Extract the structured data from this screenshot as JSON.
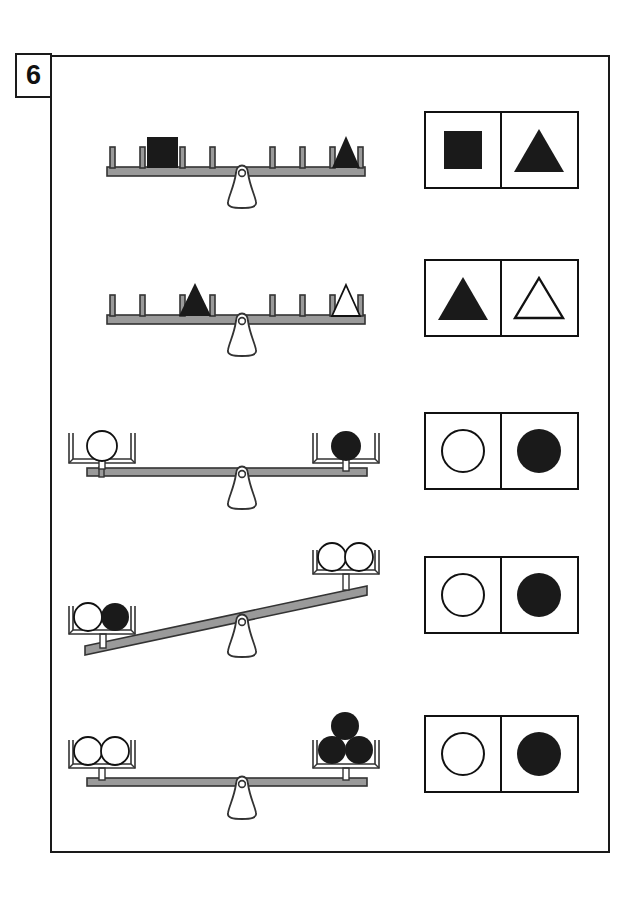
{
  "worksheet": {
    "number_label": "6",
    "colors": {
      "ink": "#1a1a1a",
      "beam_fill": "#9a9a9a",
      "beam_stroke": "#333333",
      "fill_black": "#1a1a1a",
      "fill_white": "#ffffff",
      "page_background": "#ffffff"
    }
  },
  "rows": [
    {
      "id": "row-1",
      "balance": {
        "style": "pegged-beam",
        "tilt": "level",
        "left": {
          "shapes": [
            {
              "type": "square",
              "fill": "black",
              "count": 1
            }
          ]
        },
        "right": {
          "shapes": [
            {
              "type": "triangle",
              "fill": "black",
              "count": 1
            }
          ]
        },
        "peg_count": 8
      },
      "answer": {
        "left": {
          "type": "square",
          "fill": "black"
        },
        "right": {
          "type": "triangle",
          "fill": "black"
        }
      }
    },
    {
      "id": "row-2",
      "balance": {
        "style": "pegged-beam",
        "tilt": "level",
        "left": {
          "shapes": [
            {
              "type": "triangle",
              "fill": "black",
              "count": 1
            }
          ]
        },
        "right": {
          "shapes": [
            {
              "type": "triangle",
              "fill": "white",
              "count": 1
            }
          ]
        },
        "peg_count": 8
      },
      "answer": {
        "left": {
          "type": "triangle",
          "fill": "black"
        },
        "right": {
          "type": "triangle",
          "fill": "white"
        }
      }
    },
    {
      "id": "row-3",
      "balance": {
        "style": "tray-beam",
        "tilt": "level",
        "left": {
          "shapes": [
            {
              "type": "circle",
              "fill": "white",
              "count": 1
            }
          ]
        },
        "right": {
          "shapes": [
            {
              "type": "circle",
              "fill": "black",
              "count": 1
            }
          ]
        }
      },
      "answer": {
        "left": {
          "type": "circle",
          "fill": "white"
        },
        "right": {
          "type": "circle",
          "fill": "black"
        }
      }
    },
    {
      "id": "row-4",
      "balance": {
        "style": "tray-beam",
        "tilt": "left-down",
        "left": {
          "shapes": [
            {
              "type": "circle",
              "fill": "white",
              "count": 1
            },
            {
              "type": "circle",
              "fill": "black",
              "count": 1
            }
          ]
        },
        "right": {
          "shapes": [
            {
              "type": "circle",
              "fill": "white",
              "count": 2
            }
          ]
        }
      },
      "answer": {
        "left": {
          "type": "circle",
          "fill": "white"
        },
        "right": {
          "type": "circle",
          "fill": "black"
        }
      }
    },
    {
      "id": "row-5",
      "balance": {
        "style": "tray-beam",
        "tilt": "level",
        "left": {
          "shapes": [
            {
              "type": "circle",
              "fill": "white",
              "count": 2
            }
          ]
        },
        "right": {
          "shapes": [
            {
              "type": "circle",
              "fill": "black",
              "count": 3
            }
          ]
        }
      },
      "answer": {
        "left": {
          "type": "circle",
          "fill": "white"
        },
        "right": {
          "type": "circle",
          "fill": "black"
        }
      }
    }
  ]
}
